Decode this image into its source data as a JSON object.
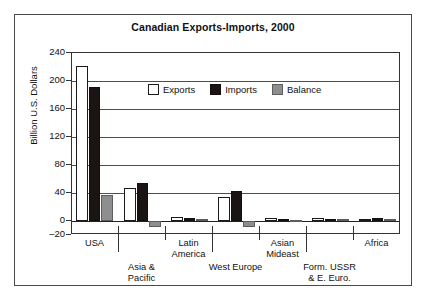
{
  "chart_data": {
    "type": "bar",
    "title": "Canadian Exports-Imports, 2000",
    "xlabel": "",
    "ylabel": "Billion U.S. Dollars",
    "ylim": [
      -20,
      240
    ],
    "yticks": [
      240,
      200,
      160,
      120,
      80,
      40,
      0,
      -20
    ],
    "grid": true,
    "legend_position": "inside-top-center",
    "categories": [
      "USA",
      "Asia &\nPacific",
      "Latin\nAmerica",
      "West Europe",
      "Asian\nMideast",
      "Form. USSR\n& E. Euro.",
      "Africa"
    ],
    "series": [
      {
        "name": "Exports",
        "color": "#ffffff",
        "values": [
          222,
          47,
          6,
          34,
          4,
          4,
          3
        ]
      },
      {
        "name": "Imports",
        "color": "#1a1412",
        "values": [
          192,
          55,
          5,
          43,
          3,
          3,
          4
        ]
      },
      {
        "name": "Balance",
        "color": "#8e8e8e",
        "values": [
          37,
          -8,
          3,
          -9,
          2,
          3,
          3
        ]
      }
    ]
  },
  "legend": {
    "items": [
      {
        "label": "Exports",
        "swatch": "exports"
      },
      {
        "label": "Imports",
        "swatch": "imports"
      },
      {
        "label": "Balance",
        "swatch": "balance"
      }
    ]
  }
}
